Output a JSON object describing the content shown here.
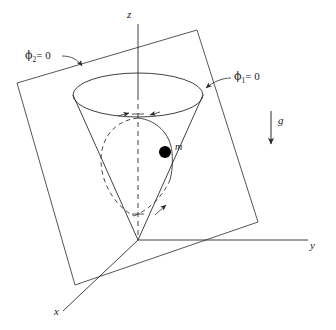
{
  "figure": {
    "stroke_color": "#2b2b2b",
    "mass_color": "#000000",
    "background": "#ffffff",
    "axes": {
      "z_label": "z",
      "y_label": "y",
      "x_label": "x"
    },
    "annotations": {
      "phi2_symbol": "ϕ",
      "phi2_sub": "2",
      "phi2_eq": "= 0",
      "phi2_full": "ϕ₂ = 0",
      "phi1_symbol": "ϕ",
      "phi1_sub": "1",
      "phi1_eq": "= 0",
      "phi1_full": "ϕ₁ = 0",
      "gravity_label": "g",
      "mass_label": "m"
    },
    "geometry": {
      "origin": [
        138,
        240
      ],
      "cone_rim_center": [
        138,
        95
      ],
      "cone_rim_rx": 65,
      "cone_rim_ry": 22,
      "mass_point": [
        165,
        152
      ],
      "mass_radius": 6,
      "plane_corners": [
        [
          17,
          83
        ],
        [
          197,
          30
        ],
        [
          258,
          222
        ],
        [
          75,
          285
        ]
      ],
      "gravity_arrow": [
        [
          271,
          111
        ],
        [
          271,
          146
        ]
      ]
    }
  }
}
